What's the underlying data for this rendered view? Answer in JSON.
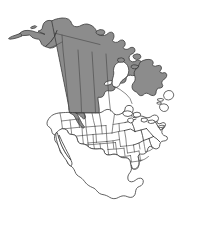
{
  "figure": {
    "type": "range-distribution-map",
    "title": "",
    "caption": "",
    "region": "North America",
    "background_color": "#ffffff",
    "outline_color": "#3a3a3a",
    "shaded_range_color": "#8c8c8c",
    "unshaded_color": "#ffffff",
    "width_px": 199,
    "height_px": 235
  },
  "map_data": {
    "projection_note": "North America, conic-like orientation",
    "shaded_regions": [
      {
        "id": "alaska",
        "label": "Alaska",
        "shaded": true
      },
      {
        "id": "yukon",
        "label": "Yukon",
        "shaded": true
      },
      {
        "id": "northwest-territories",
        "label": "Northwest Territories",
        "shaded": true
      },
      {
        "id": "nunavut-mainland",
        "label": "Nunavut mainland",
        "shaded": true
      },
      {
        "id": "british-columbia",
        "label": "British Columbia",
        "shaded": true
      },
      {
        "id": "alberta-north",
        "label": "Northern Alberta",
        "shaded": true
      },
      {
        "id": "saskatchewan-north",
        "label": "Northern Saskatchewan",
        "shaded": true
      },
      {
        "id": "manitoba-north",
        "label": "Northern Manitoba",
        "shaded": true
      },
      {
        "id": "ontario-north",
        "label": "Northern Ontario",
        "shaded": true
      },
      {
        "id": "quebec-labrador",
        "label": "Quebec and Labrador",
        "shaded": true
      },
      {
        "id": "idaho-strip",
        "label": "Idaho / western Montana strip",
        "shaded": true
      }
    ],
    "unshaded_regions": [
      {
        "id": "contiguous-us",
        "label": "Contiguous United States",
        "shaded": false
      },
      {
        "id": "mexico",
        "label": "Mexico",
        "shaded": false
      },
      {
        "id": "central-america",
        "label": "Central America",
        "shaded": false
      },
      {
        "id": "hudson-bay",
        "label": "Hudson Bay",
        "shaded": false
      },
      {
        "id": "newfoundland",
        "label": "Newfoundland",
        "shaded": false
      },
      {
        "id": "maritimes",
        "label": "Maritime Provinces",
        "shaded": false
      },
      {
        "id": "baja-california",
        "label": "Baja California",
        "shaded": false
      },
      {
        "id": "florida",
        "label": "Florida",
        "shaded": false
      }
    ],
    "features": {
      "state_borders_visible": true,
      "province_borders_visible": true,
      "mexico_internal_borders_visible": false,
      "coastline_visible": true,
      "graticule_visible": false,
      "legend_visible": false,
      "scale_bar_visible": false,
      "labels_visible": false
    }
  }
}
